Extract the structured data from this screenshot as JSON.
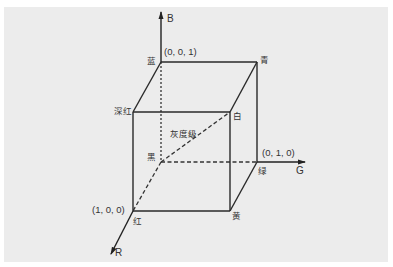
{
  "diagram": {
    "type": "rgb-color-cube",
    "axes": {
      "r": "R",
      "g": "G",
      "b": "B"
    },
    "vertices": {
      "black": "黑",
      "red": "红",
      "green": "绿",
      "blue": "蓝",
      "magenta": "深红",
      "cyan": "青",
      "yellow": "黄",
      "white": "白"
    },
    "coordinates": {
      "blue": "(0, 0, 1)",
      "green": "(0, 1, 0)",
      "red": "(1, 0, 0)"
    },
    "grayscale_label": "灰度级"
  }
}
